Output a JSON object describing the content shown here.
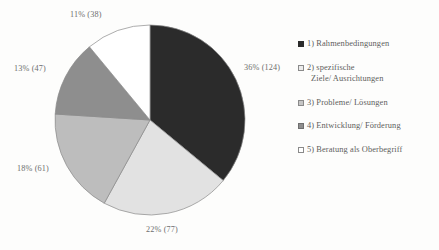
{
  "chart_data": {
    "type": "pie",
    "title": "",
    "subtitle": "",
    "xlabel": "",
    "ylabel": "",
    "legend_position": "right",
    "grid": false,
    "label_format": "percent (count)",
    "total_count": 347,
    "categories": [
      "1) Rahmenbedingungen",
      "2) spezifische Ziele/ Ausrichtungen",
      "3) Probleme/ Lösungen",
      "4) Entwicklung/ Förderung",
      "5) Beratung als Oberbegriff"
    ],
    "values": [
      36,
      22,
      18,
      13,
      11
    ],
    "counts": [
      124,
      77,
      61,
      47,
      38
    ],
    "colors": [
      "#2b2b2b",
      "#e2e2e2",
      "#bdbdbd",
      "#8e8e8e",
      "#ffffff"
    ],
    "slices": [
      {
        "label": "1) Rahmenbedingungen",
        "percent": 36,
        "count": 124,
        "data_label": "36% (124)",
        "color": "#2b2b2b"
      },
      {
        "label": "2) spezifische Ziele/ Ausrichtungen",
        "percent": 22,
        "count": 77,
        "data_label": "22% (77)",
        "color": "#e2e2e2"
      },
      {
        "label": "3) Probleme/ Lösungen",
        "percent": 18,
        "count": 61,
        "data_label": "18% (61)",
        "color": "#bdbdbd"
      },
      {
        "label": "4) Entwicklung/ Förderung",
        "percent": 13,
        "count": 47,
        "data_label": "13% (47)",
        "color": "#8e8e8e"
      },
      {
        "label": "5) Beratung als Oberbegriff",
        "percent": 11,
        "count": 38,
        "data_label": "11% (38)",
        "color": "#ffffff"
      }
    ]
  },
  "labels": {
    "slice1": "36% (124)",
    "slice2": "22% (77)",
    "slice3": "18% (61)",
    "slice4": "13% (47)",
    "slice5": "11% (38)"
  },
  "legend": {
    "items": [
      {
        "marker": "filled-black-square",
        "text": "1) Rahmenbedingungen",
        "text_line2": "",
        "color": "#2b2b2b"
      },
      {
        "marker": "outlined-white-square",
        "text": "2) spezifische",
        "text_line2": "Ziele/ Ausrichtungen",
        "color": "#e8e8e8"
      },
      {
        "marker": "filled-light-gray-square",
        "text": "3) Probleme/ Lösungen",
        "text_line2": "",
        "color": "#bdbdbd"
      },
      {
        "marker": "filled-gray-square",
        "text": "4) Entwicklung/ Förderung",
        "text_line2": "",
        "color": "#8e8e8e"
      },
      {
        "marker": "outlined-white-square",
        "text": "5) Beratung als Oberbegriff",
        "text_line2": "",
        "color": "#ffffff"
      }
    ]
  },
  "theme": {
    "background": "#fdfdfc",
    "text_color": "#5d5d5d",
    "label_color": "#6e6e6e",
    "slice_outline": "#8a8a8a"
  }
}
